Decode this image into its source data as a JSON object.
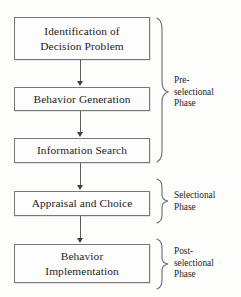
{
  "diagram": {
    "type": "flowchart",
    "stroke_color": "#77787a",
    "text_color": "#1d1c1c",
    "background_color": "#fdfdfc",
    "stages": [
      {
        "id": "identification-of-decision-problem",
        "lines": [
          "Identification of",
          "Decision Problem"
        ]
      },
      {
        "id": "behavior-generation",
        "lines": [
          "Behavior Generation"
        ]
      },
      {
        "id": "information-search",
        "lines": [
          "Information Search"
        ]
      },
      {
        "id": "appraisal-and-choice",
        "lines": [
          "Appraisal and Choice"
        ]
      },
      {
        "id": "behavior-implementation",
        "lines": [
          "Behavior",
          "Implementation"
        ]
      }
    ],
    "phases": [
      {
        "id": "pre-selectional-phase",
        "lines": [
          "Pre-",
          "selectional",
          "Phase"
        ]
      },
      {
        "id": "selectional-phase",
        "lines": [
          "Selectional",
          "Phase"
        ]
      },
      {
        "id": "post-selectional-phase",
        "lines": [
          "Post-",
          "selectional",
          "Phase"
        ]
      }
    ]
  }
}
